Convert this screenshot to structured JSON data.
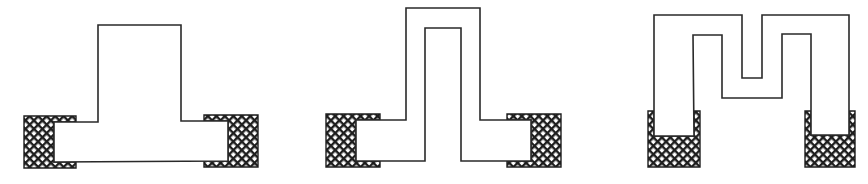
{
  "diagram": {
    "colors": {
      "stroke": "#2a2a2a",
      "background": "#ffffff",
      "hatch": "#1e1e1e"
    },
    "figures": [
      {
        "id": "shape-1",
        "label": "T-shaped trace",
        "pads": 2
      },
      {
        "id": "shape-2",
        "label": "Inverted-U loop trace",
        "pads": 2
      },
      {
        "id": "shape-3",
        "label": "M-shaped meander trace",
        "pads": 2
      }
    ]
  }
}
